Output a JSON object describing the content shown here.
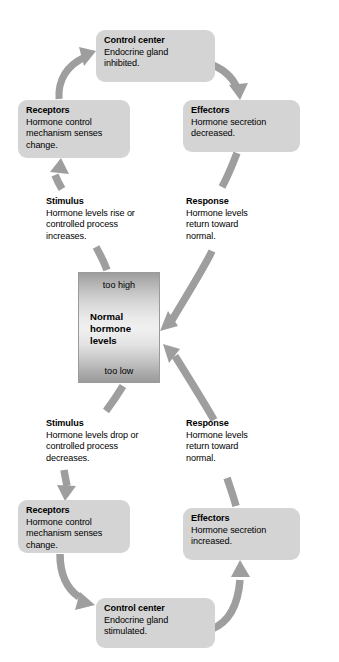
{
  "figure": {
    "type": "cycle-diagram",
    "caption": ""
  },
  "colors": {
    "node_fill": "#d4d4d4",
    "arrow_fill": "#9e9e9e",
    "center_border": "#9a9a9a",
    "text": "#000000",
    "background": "#ffffff"
  },
  "center": {
    "too_high_label": "too high",
    "normal_label": "Normal\nhormone\nlevels",
    "normal_line1": "Normal",
    "normal_line2": "hormone",
    "normal_line3": "levels",
    "too_low_label": "too low"
  },
  "upper_loop": {
    "control_center": {
      "title": "Control center",
      "line1": "Endocrine gland",
      "line2": "inhibited."
    },
    "effectors": {
      "title": "Effectors",
      "line1": "Hormone secretion",
      "line2": "decreased."
    },
    "receptors": {
      "title": "Receptors",
      "line1": "Hormone control",
      "line2": "mechanism senses",
      "line3": "change."
    },
    "stimulus": {
      "title": "Stimulus",
      "line1": "Hormone levels rise or",
      "line2": "controlled process",
      "line3": "increases."
    },
    "response": {
      "title": "Response",
      "line1": "Hormone levels",
      "line2": "return toward",
      "line3": "normal."
    }
  },
  "lower_loop": {
    "control_center": {
      "title": "Control center",
      "line1": "Endocrine gland",
      "line2": "stimulated."
    },
    "effectors": {
      "title": "Effectors",
      "line1": "Hormone secretion",
      "line2": "increased."
    },
    "receptors": {
      "title": "Receptors",
      "line1": "Hormone control",
      "line2": "mechanism senses",
      "line3": "change."
    },
    "stimulus": {
      "title": "Stimulus",
      "line1": "Hormone levels drop or",
      "line2": "controlled process",
      "line3": "decreases."
    },
    "response": {
      "title": "Response",
      "line1": "Hormone levels",
      "line2": "return toward",
      "line3": "normal."
    }
  }
}
